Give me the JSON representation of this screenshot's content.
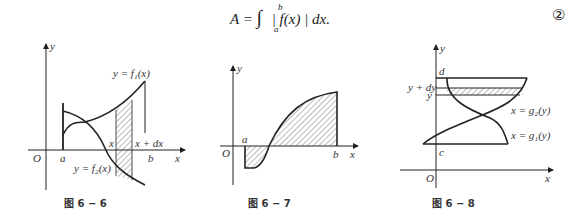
{
  "formula": {
    "lhs": "A =",
    "integral": "∫",
    "upper": "b",
    "lower": "a",
    "integrand": "| f(x) | dx.",
    "number": "②"
  },
  "figures": [
    {
      "caption": "图 6 − 6",
      "labels": {
        "y_axis": "y",
        "x_axis": "x",
        "origin": "O",
        "a": "a",
        "b": "b",
        "x": "x",
        "x_dx": "x + dx",
        "f1": "y = f₁(x)",
        "f2": "y = f₂(x)"
      }
    },
    {
      "caption": "图 6 − 7",
      "labels": {
        "y_axis": "y",
        "x_axis": "x",
        "origin": "O",
        "a": "a",
        "b": "b"
      }
    },
    {
      "caption": "图 6 − 8",
      "labels": {
        "y_axis": "y",
        "x_axis": "x",
        "origin": "O",
        "c": "c",
        "d": "d",
        "y": "y",
        "y_dy": "y + dy",
        "g2": "x = g₂(y)",
        "g1": "x = g₁(y)"
      }
    }
  ],
  "colors": {
    "ink": "#222222",
    "hatch": "#555555"
  }
}
